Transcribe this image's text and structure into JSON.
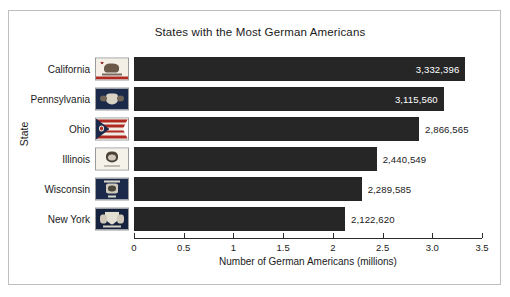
{
  "chart_data": {
    "type": "bar",
    "orientation": "horizontal",
    "title": "States with the Most German Americans",
    "xlabel": "Number of German Americans (millions)",
    "ylabel": "State",
    "categories": [
      "California",
      "Pennsylvania",
      "Ohio",
      "Illinois",
      "Wisconsin",
      "New York"
    ],
    "values": [
      3332396,
      3115560,
      2866565,
      2440549,
      2289585,
      2122620
    ],
    "value_labels": [
      "3,332,396",
      "3,115,560",
      "2,866,565",
      "2,440,549",
      "2,289,585",
      "2,122,620"
    ],
    "values_millions": [
      3.332396,
      3.11556,
      2.866565,
      2.440549,
      2.289585,
      2.12262
    ],
    "xlim": [
      0,
      3.5
    ],
    "xticks": [
      0,
      0.5,
      1,
      1.5,
      2,
      2.5,
      3.0,
      3.5
    ],
    "xtick_labels": [
      "0",
      "0.5",
      "1",
      "1.5",
      "2",
      "2.5",
      "3.0",
      "3.5"
    ],
    "grid": false,
    "legend": null,
    "bar_color": "#262626",
    "label_inside_flags": [
      true,
      true,
      false,
      false,
      false,
      false
    ],
    "category_icons": [
      "california-flag-icon",
      "pennsylvania-flag-icon",
      "ohio-flag-icon",
      "illinois-flag-icon",
      "wisconsin-flag-icon",
      "newyork-flag-icon"
    ]
  },
  "figure": {
    "background": "#ffffff",
    "border_color": "#bfbfbf"
  }
}
